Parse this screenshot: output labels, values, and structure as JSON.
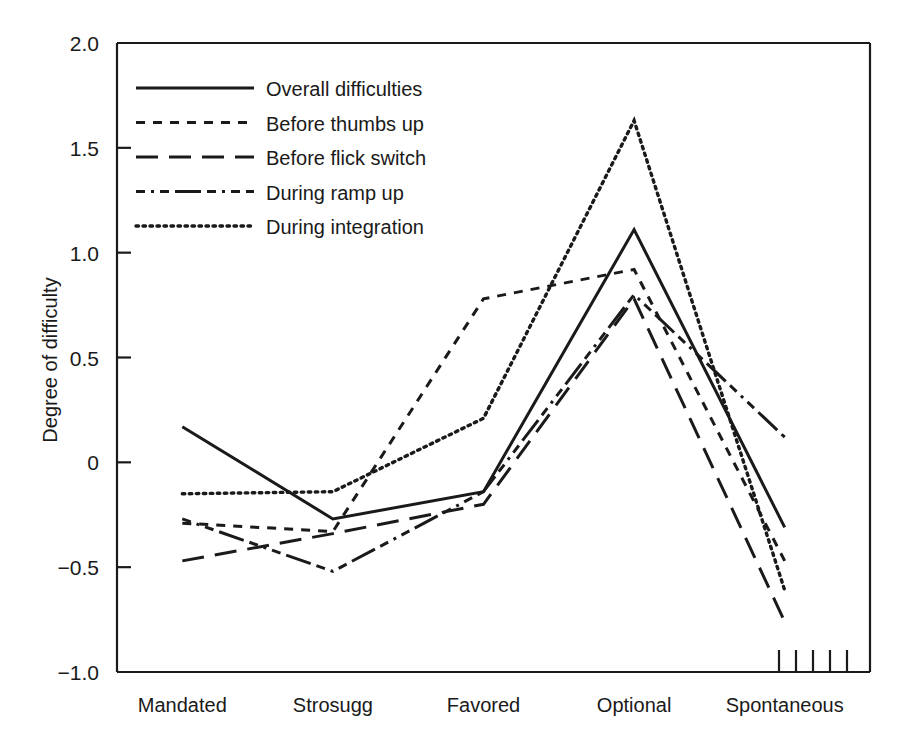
{
  "chart_data": {
    "type": "line",
    "title": "",
    "xlabel": "",
    "ylabel": "Degree of difficulty",
    "categories": [
      "Mandated",
      "Strosugg",
      "Favored",
      "Optional",
      "Spontaneous"
    ],
    "ylim": [
      -1.0,
      2.0
    ],
    "ytick_labels": [
      "2.0",
      "1.5",
      "1.0",
      "0.5",
      "0",
      "-0.5",
      "-1.0"
    ],
    "ytick_values": [
      2.0,
      1.5,
      1.0,
      0.5,
      0,
      -0.5,
      -1.0
    ],
    "grid": false,
    "legend_position": "upper-left-inside",
    "line_color": "#1a1a1a",
    "series": [
      {
        "name": "Overall difficulties",
        "dash": "solid",
        "values": [
          0.17,
          -0.27,
          -0.14,
          1.11,
          -0.31
        ]
      },
      {
        "name": "Before thumbs up",
        "dash": "short-dash",
        "values": [
          -0.29,
          -0.33,
          0.78,
          0.92,
          -0.47
        ]
      },
      {
        "name": "Before flick switch",
        "dash": "long-dash",
        "values": [
          -0.47,
          -0.34,
          -0.2,
          0.78,
          -0.76
        ]
      },
      {
        "name": "During ramp up",
        "dash": "dash-dot",
        "values": [
          -0.27,
          -0.52,
          -0.14,
          0.8,
          0.12
        ]
      },
      {
        "name": "During integration",
        "dash": "dotted",
        "values": [
          -0.15,
          -0.14,
          0.21,
          1.63,
          -0.61
        ]
      }
    ],
    "extra_ticks": {
      "name": "minor-ticks-bottom-right",
      "count": 5
    }
  }
}
